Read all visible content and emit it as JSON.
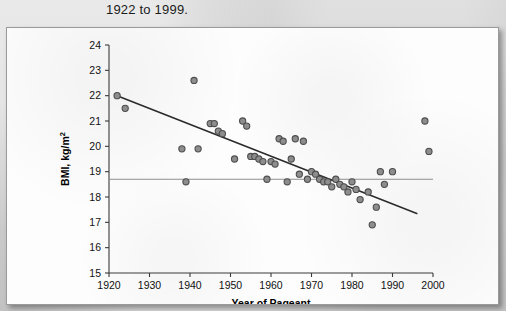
{
  "page": {
    "caption": "1922 to 1999."
  },
  "chart_data": {
    "type": "scatter",
    "title": "",
    "xlabel": "Year of Pageant",
    "ylabel": "BMI, kg/m²",
    "xlim": [
      1920,
      2000
    ],
    "ylim": [
      15,
      24
    ],
    "xticks": [
      1920,
      1930,
      1940,
      1950,
      1960,
      1970,
      1980,
      1990,
      2000
    ],
    "yticks": [
      15,
      16,
      17,
      18,
      19,
      20,
      21,
      22,
      23,
      24
    ],
    "grid": false,
    "legend": "none",
    "series": [
      {
        "name": "Miss America BMI",
        "marker": "filled-circle",
        "color": "#8d8d8d",
        "edge_color": "#4d4d4d",
        "points": [
          [
            1922,
            22.0
          ],
          [
            1924,
            21.5
          ],
          [
            1938,
            19.9
          ],
          [
            1939,
            18.6
          ],
          [
            1941,
            22.6
          ],
          [
            1942,
            19.9
          ],
          [
            1945,
            20.9
          ],
          [
            1946,
            20.9
          ],
          [
            1947,
            20.6
          ],
          [
            1948,
            20.5
          ],
          [
            1951,
            19.5
          ],
          [
            1953,
            21.0
          ],
          [
            1954,
            20.8
          ],
          [
            1955,
            19.6
          ],
          [
            1956,
            19.6
          ],
          [
            1957,
            19.5
          ],
          [
            1958,
            19.4
          ],
          [
            1959,
            18.7
          ],
          [
            1960,
            19.4
          ],
          [
            1961,
            19.3
          ],
          [
            1962,
            20.3
          ],
          [
            1963,
            20.2
          ],
          [
            1964,
            18.6
          ],
          [
            1965,
            19.5
          ],
          [
            1966,
            20.3
          ],
          [
            1967,
            18.9
          ],
          [
            1968,
            20.2
          ],
          [
            1969,
            18.7
          ],
          [
            1970,
            19.0
          ],
          [
            1971,
            18.9
          ],
          [
            1972,
            18.7
          ],
          [
            1973,
            18.6
          ],
          [
            1974,
            18.6
          ],
          [
            1975,
            18.4
          ],
          [
            1976,
            18.7
          ],
          [
            1977,
            18.5
          ],
          [
            1978,
            18.4
          ],
          [
            1979,
            18.2
          ],
          [
            1980,
            18.6
          ],
          [
            1981,
            18.3
          ],
          [
            1982,
            17.9
          ],
          [
            1984,
            18.2
          ],
          [
            1985,
            16.9
          ],
          [
            1986,
            17.6
          ],
          [
            1987,
            19.0
          ],
          [
            1988,
            18.5
          ],
          [
            1990,
            19.0
          ],
          [
            1998,
            21.0
          ],
          [
            1999,
            19.8
          ]
        ]
      }
    ],
    "annotations": [
      {
        "kind": "regression-line",
        "label": "trend line",
        "x0": 1922,
        "y0": 22.0,
        "x1": 1996,
        "y1": 17.35,
        "color": "#2b2b2b"
      },
      {
        "kind": "reference-line",
        "label": "mean BMI line",
        "orientation": "horizontal",
        "y": 18.7,
        "x0": 1920,
        "x1": 2000,
        "color": "#8e8e8e"
      }
    ]
  }
}
